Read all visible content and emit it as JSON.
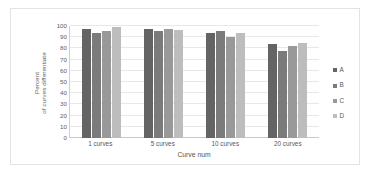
{
  "chart_data": {
    "type": "bar",
    "title": "",
    "xlabel": "Curve num",
    "ylabel": "Percent of curves differentiate",
    "ylabel_lines": [
      "Percent",
      "of curves differentiate"
    ],
    "categories": [
      "1 curves",
      "5 curves",
      "10 curves",
      "20 curves"
    ],
    "series": [
      {
        "name": "A",
        "color": "#646464",
        "values": [
          97,
          97.5,
          93.5,
          84
        ]
      },
      {
        "name": "B",
        "color": "#7b7b7b",
        "values": [
          94,
          95.5,
          95.5,
          77.5
        ]
      },
      {
        "name": "C",
        "color": "#999999",
        "values": [
          95.5,
          97.5,
          90,
          82
        ]
      },
      {
        "name": "D",
        "color": "#bdbdbd",
        "values": [
          99.5,
          96.5,
          93.5,
          84.5
        ]
      }
    ],
    "ylim": [
      0,
      100
    ],
    "ytick_labels": [
      "100",
      "90",
      "80",
      "70",
      "60",
      "50",
      "40",
      "30",
      "20",
      "10",
      "0"
    ],
    "ytick_values": [
      100,
      90,
      80,
      70,
      60,
      50,
      40,
      30,
      20,
      10,
      0
    ],
    "ytick_step": 10,
    "grid": "horizontal",
    "legend_position": "right",
    "legend_entries": [
      "A",
      "B",
      "C",
      "D"
    ],
    "border_color": "#e3e3e3",
    "gridline_color": "#e8e8e8",
    "text_color": "#5a5a5a",
    "background": "#ffffff"
  }
}
